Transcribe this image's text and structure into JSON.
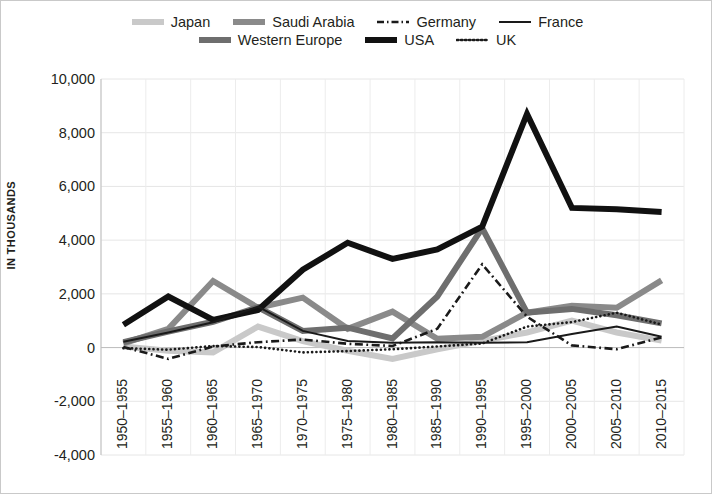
{
  "chart_data": {
    "type": "line",
    "title": "",
    "subtitle": "",
    "xlabel": "",
    "ylabel": "IN THOUSANDS",
    "ylim": [
      -4000,
      10000
    ],
    "ytick_values": [
      10000,
      8000,
      6000,
      4000,
      2000,
      0,
      -2000,
      -4000
    ],
    "ytick_labels": [
      "10,000",
      "8,000",
      "6,000",
      "4,000",
      "2,000",
      "0",
      "-2,000",
      "-4,000"
    ],
    "grid": true,
    "legend_position": "top",
    "categories": [
      "1950–1955",
      "1955–1960",
      "1960–1965",
      "1965–1970",
      "1970–1975",
      "1975–1980",
      "1980–1985",
      "1985–1990",
      "1990–1995",
      "1995–2000",
      "2000–2005",
      "2005–2010",
      "2010–2015"
    ],
    "series": [
      {
        "name": "Japan",
        "color": "#c9c9c9",
        "style": "solid",
        "width": 6,
        "values": [
          40,
          -120,
          -180,
          780,
          240,
          -120,
          -420,
          -60,
          250,
          560,
          1000,
          560,
          260
        ]
      },
      {
        "name": "Saudi Arabia",
        "color": "#8a8a8a",
        "style": "solid",
        "width": 6,
        "values": [
          160,
          700,
          2480,
          1480,
          1860,
          700,
          1340,
          330,
          400,
          1300,
          1560,
          1480,
          2500
        ]
      },
      {
        "name": "Germany",
        "color": "#1a1a1a",
        "style": "dashdot",
        "width": 2.6,
        "values": [
          20,
          -420,
          40,
          200,
          300,
          140,
          60,
          700,
          3100,
          1150,
          80,
          -60,
          380
        ]
      },
      {
        "name": "France",
        "color": "#1a1a1a",
        "style": "solid",
        "width": 2,
        "values": [
          220,
          560,
          940,
          1520,
          620,
          250,
          180,
          200,
          180,
          200,
          500,
          780,
          400
        ]
      },
      {
        "name": "Western Europe",
        "color": "#6e6e6e",
        "style": "solid",
        "width": 6,
        "values": [
          200,
          600,
          960,
          1500,
          620,
          740,
          340,
          1900,
          4450,
          1300,
          1440,
          1200,
          900
        ]
      },
      {
        "name": "USA",
        "color": "#111111",
        "style": "solid",
        "width": 6,
        "values": [
          850,
          1900,
          1030,
          1400,
          2900,
          3900,
          3300,
          3650,
          4500,
          8700,
          5200,
          5150,
          5050
        ]
      },
      {
        "name": "UK",
        "color": "#1a1a1a",
        "style": "dotted",
        "width": 2.6,
        "values": [
          -20,
          -80,
          60,
          20,
          -180,
          -130,
          -60,
          40,
          150,
          780,
          950,
          1300,
          860
        ]
      }
    ]
  },
  "legend": {
    "rows": [
      [
        {
          "label": "Japan",
          "key": "japan"
        },
        {
          "label": "Saudi Arabia",
          "key": "saudi-arabia"
        },
        {
          "label": "Germany",
          "key": "germany"
        },
        {
          "label": "France",
          "key": "france"
        }
      ],
      [
        {
          "label": "Western Europe",
          "key": "western-europe"
        },
        {
          "label": "USA",
          "key": "usa"
        },
        {
          "label": "UK",
          "key": "uk"
        }
      ]
    ]
  },
  "axes": {
    "y_title": "IN THOUSANDS"
  }
}
